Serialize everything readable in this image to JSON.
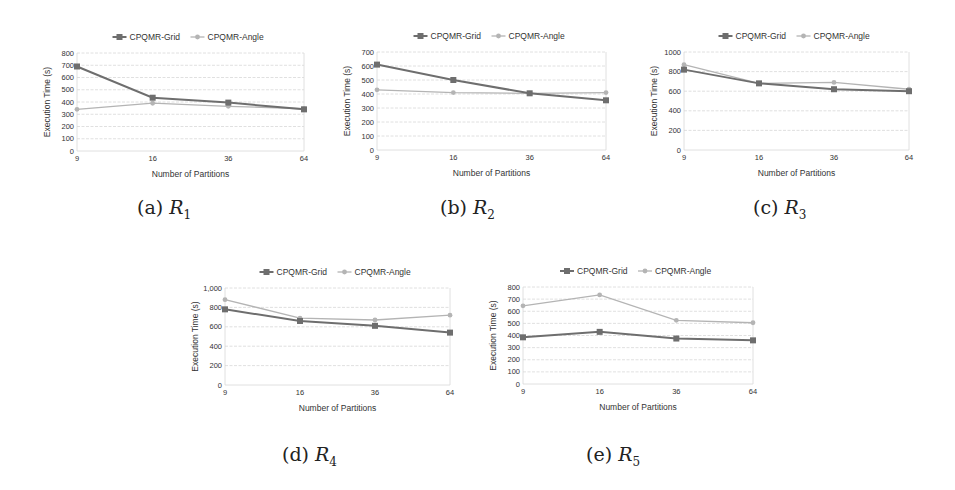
{
  "figure": {
    "series_names": [
      "CPQMR-Grid",
      "CPQMR-Angle"
    ],
    "series_colors": {
      "grid": "#6e6e6e",
      "angle": "#b4b4b4"
    },
    "grid_color": "#d8d8d8"
  },
  "chart_data": [
    {
      "id": "a",
      "caption_letter": "(a)",
      "caption_var": "R",
      "caption_sub": "1",
      "type": "line",
      "x": [
        "9",
        "16",
        "36",
        "64"
      ],
      "xlabel": "Number of Partitions",
      "ylabel": "Execution Time (s)",
      "ylim": [
        0,
        800
      ],
      "yticks": [
        "0",
        "100",
        "200",
        "300",
        "400",
        "500",
        "600",
        "700",
        "800"
      ],
      "grid": true,
      "legend_position": "top",
      "series": [
        {
          "name": "CPQMR-Grid",
          "values": [
            690,
            435,
            395,
            340
          ]
        },
        {
          "name": "CPQMR-Angle",
          "values": [
            340,
            390,
            365,
            345
          ]
        }
      ]
    },
    {
      "id": "b",
      "caption_letter": "(b)",
      "caption_var": "R",
      "caption_sub": "2",
      "type": "line",
      "x": [
        "9",
        "16",
        "36",
        "64"
      ],
      "xlabel": "Number of Partitions",
      "ylabel": "Execution Time (s)",
      "ylim": [
        0,
        700
      ],
      "yticks": [
        "0",
        "100",
        "200",
        "300",
        "400",
        "500",
        "600",
        "700"
      ],
      "grid": true,
      "legend_position": "top",
      "series": [
        {
          "name": "CPQMR-Grid",
          "values": [
            610,
            500,
            405,
            355
          ]
        },
        {
          "name": "CPQMR-Angle",
          "values": [
            430,
            410,
            405,
            410
          ]
        }
      ]
    },
    {
      "id": "c",
      "caption_letter": "(c)",
      "caption_var": "R",
      "caption_sub": "3",
      "type": "line",
      "x": [
        "9",
        "16",
        "36",
        "64"
      ],
      "xlabel": "Number of Partitions",
      "ylabel": "Execution Time (s)",
      "ylim": [
        0,
        1000
      ],
      "yticks": [
        "0",
        "200",
        "400",
        "600",
        "800",
        "1000"
      ],
      "grid": true,
      "legend_position": "top",
      "series": [
        {
          "name": "CPQMR-Grid",
          "values": [
            820,
            680,
            620,
            600
          ]
        },
        {
          "name": "CPQMR-Angle",
          "values": [
            870,
            680,
            690,
            620
          ]
        }
      ]
    },
    {
      "id": "d",
      "caption_letter": "(d)",
      "caption_var": "R",
      "caption_sub": "4",
      "type": "line",
      "x": [
        "9",
        "16",
        "36",
        "64"
      ],
      "xlabel": "Number of Partitions",
      "ylabel": "Execution Time (s)",
      "ylim": [
        0,
        1000
      ],
      "yticks": [
        "0",
        "200",
        "400",
        "600",
        "800",
        "1,000"
      ],
      "grid": true,
      "legend_position": "top",
      "series": [
        {
          "name": "CPQMR-Grid",
          "values": [
            780,
            660,
            610,
            540
          ]
        },
        {
          "name": "CPQMR-Angle",
          "values": [
            880,
            690,
            670,
            720
          ]
        }
      ]
    },
    {
      "id": "e",
      "caption_letter": "(e)",
      "caption_var": "R",
      "caption_sub": "5",
      "type": "line",
      "x": [
        "9",
        "16",
        "36",
        "64"
      ],
      "xlabel": "Number of Partitions",
      "ylabel": "Execution Time (s)",
      "ylim": [
        0,
        800
      ],
      "yticks": [
        "0",
        "100",
        "200",
        "300",
        "400",
        "500",
        "600",
        "700",
        "800"
      ],
      "grid": true,
      "legend_position": "top",
      "series": [
        {
          "name": "CPQMR-Grid",
          "values": [
            385,
            430,
            375,
            360
          ]
        },
        {
          "name": "CPQMR-Angle",
          "values": [
            645,
            735,
            525,
            505
          ]
        }
      ]
    }
  ]
}
